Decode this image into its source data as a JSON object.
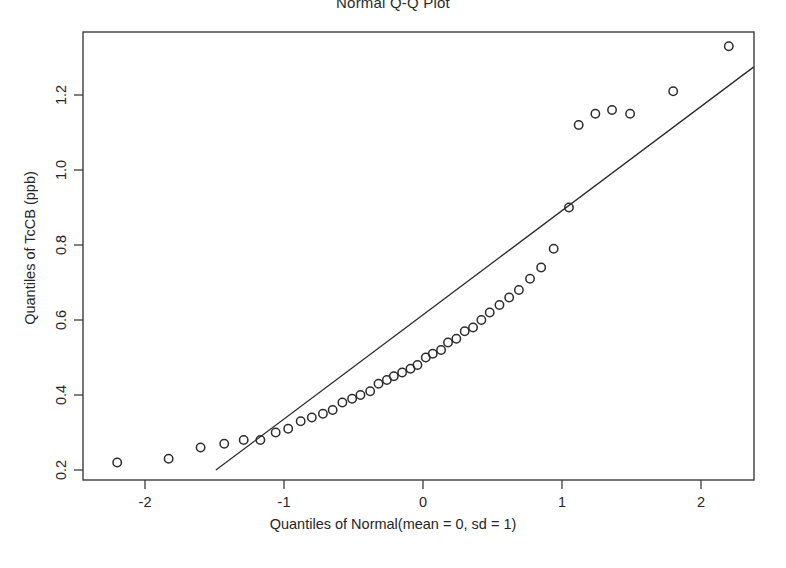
{
  "chart_data": {
    "type": "scatter",
    "title": "Normal Q-Q Plot",
    "xlabel": "Quantiles of Normal(mean = 0, sd = 1)",
    "ylabel": "Quantiles of TcCB (ppb)",
    "xlim": [
      -2.45,
      2.38
    ],
    "ylim": [
      0.155,
      1.41
    ],
    "xticks": [
      -2,
      -1,
      0,
      1,
      2
    ],
    "xticklabels": [
      "-2",
      "-1",
      "0",
      "1",
      "2"
    ],
    "yticks": [
      0.2,
      0.4,
      0.6,
      0.8,
      1.0,
      1.2
    ],
    "yticklabels": [
      "0.2",
      "0.4",
      "0.6",
      "0.8",
      "1.0",
      "1.2"
    ],
    "grid": false,
    "legend": null,
    "marker": "open-circle",
    "series": [
      {
        "name": "TcCB sample quantiles",
        "x": [
          -2.2,
          -1.83,
          -1.6,
          -1.43,
          -1.29,
          -1.17,
          -1.06,
          -0.97,
          -0.88,
          -0.8,
          -0.72,
          -0.65,
          -0.58,
          -0.51,
          -0.45,
          -0.38,
          -0.32,
          -0.26,
          -0.21,
          -0.15,
          -0.09,
          -0.04,
          0.02,
          0.07,
          0.13,
          0.18,
          0.24,
          0.3,
          0.36,
          0.42,
          0.48,
          0.55,
          0.62,
          0.69,
          0.77,
          0.85,
          0.94,
          1.05,
          1.12,
          1.24,
          1.36,
          1.49,
          1.8,
          2.2
        ],
        "y": [
          0.22,
          0.23,
          0.26,
          0.27,
          0.28,
          0.28,
          0.3,
          0.31,
          0.33,
          0.34,
          0.35,
          0.36,
          0.38,
          0.39,
          0.4,
          0.41,
          0.43,
          0.44,
          0.45,
          0.46,
          0.47,
          0.48,
          0.5,
          0.51,
          0.52,
          0.54,
          0.55,
          0.57,
          0.58,
          0.6,
          0.62,
          0.64,
          0.66,
          0.68,
          0.71,
          0.74,
          0.79,
          0.9,
          1.12,
          1.15,
          1.16,
          1.15,
          1.21,
          1.33
        ]
      }
    ],
    "fit_line": {
      "name": "reference line",
      "x0": -1.49,
      "y0": 0.2,
      "x1": 2.38,
      "y1": 1.275
    }
  },
  "axes": {
    "x_pixel_of_zero": 423,
    "x_pixels_per_unit": 139,
    "y_pixel_of_min_tick": 470,
    "y_pixels_per_0p2": 75,
    "frame": {
      "left": 83,
      "top": 32,
      "right": 754,
      "bottom": 480
    }
  },
  "colors": {
    "ink": "#2b2b2b",
    "frame": "#3d3d3d",
    "background": "#ffffff"
  }
}
